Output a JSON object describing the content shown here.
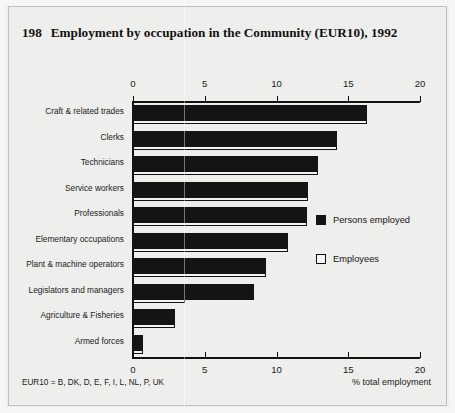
{
  "figure": {
    "number": "198",
    "title": "Employment by occupation in the Community (EUR10), 1992",
    "footnote": "EUR10 = B, DK, D, E, F, I, L, NL, P, UK"
  },
  "legend": {
    "position": "right-middle",
    "items": [
      {
        "label": "Persons employed",
        "swatch": "filled-black-square",
        "color": "#141414"
      },
      {
        "label": "Employees",
        "swatch": "open-white-square",
        "color": "#ffffff"
      }
    ]
  },
  "chart_data": {
    "type": "bar",
    "orientation": "horizontal",
    "title": "Employment by occupation in the Community (EUR10), 1992",
    "xlabel": "% total employment",
    "ylabel": "",
    "xlim": [
      0,
      20
    ],
    "xticks": [
      0,
      5,
      10,
      15,
      20
    ],
    "xticklabels": [
      "0",
      "5",
      "10",
      "15",
      "20"
    ],
    "grid": false,
    "ticks_on_top_and_bottom": true,
    "categories": [
      "Craft & related trades",
      "Clerks",
      "Technicians",
      "Service workers",
      "Professionals",
      "Elementary occupations",
      "Plant & machine operators",
      "Legislators and managers",
      "Agriculture & Fisheries",
      "Armed forces"
    ],
    "series": [
      {
        "name": "Persons employed",
        "color": "#141414",
        "values": [
          16.3,
          14.2,
          12.9,
          12.2,
          12.1,
          10.8,
          9.3,
          8.4,
          2.9,
          0.7
        ]
      },
      {
        "name": "Employees",
        "color": "#ffffff",
        "values": [
          16.3,
          14.2,
          12.9,
          12.2,
          12.1,
          10.8,
          9.3,
          3.6,
          2.9,
          0.7
        ]
      }
    ]
  }
}
